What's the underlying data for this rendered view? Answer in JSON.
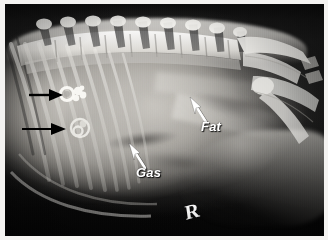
{
  "figure": {
    "modality": "radiograph",
    "view": "right lateral",
    "border_color": "#f4f3f1",
    "background_color": "#0b0b0b"
  },
  "annotations": {
    "labels": [
      {
        "id": "fat",
        "text": "Fat",
        "color": "#ffffff",
        "style": "bold-italic",
        "x": 196,
        "y": 115,
        "points_to": "retroperitoneal / falciform fat plane"
      },
      {
        "id": "gas",
        "text": "Gas",
        "color": "#ffffff",
        "style": "bold-italic",
        "x": 131,
        "y": 161,
        "points_to": "intraluminal bowel gas"
      }
    ],
    "arrows": [
      {
        "id": "arrow-fat",
        "color": "#ffffff",
        "direction": "up-left",
        "tail_x": 199,
        "tail_y": 117,
        "head_x": 186,
        "head_y": 95
      },
      {
        "id": "arrow-gas",
        "color": "#ffffff",
        "direction": "up-left",
        "tail_x": 139,
        "tail_y": 162,
        "head_x": 126,
        "head_y": 141
      },
      {
        "id": "arrow-black-upper",
        "color": "#000000",
        "direction": "right",
        "tail_x": 24,
        "tail_y": 90,
        "head_x": 52,
        "head_y": 90,
        "points_to": "mineral opacity, cranial"
      },
      {
        "id": "arrow-black-lower",
        "color": "#000000",
        "direction": "right",
        "tail_x": 17,
        "tail_y": 124,
        "head_x": 60,
        "head_y": 124,
        "points_to": "mineral opacity, caudal"
      }
    ],
    "markers": [
      {
        "id": "side-marker",
        "text": "R",
        "meaning": "right-side radiographic marker",
        "color": "#ffffff",
        "x": 180,
        "y": 196
      }
    ]
  },
  "anatomy": {
    "regions": [
      {
        "name": "lumbar-spine",
        "description": "vertebral bodies with dorsal spinous processes along the top"
      },
      {
        "name": "ribcage",
        "description": "caudal ribs over the left third of the image"
      },
      {
        "name": "pelvis",
        "description": "ilium, sacrum and femoral head at the right"
      },
      {
        "name": "abdomen",
        "description": "soft tissue viscera filling the central field"
      },
      {
        "name": "mineral-opacities",
        "description": "two bright ring-shaped mineral opacities indicated by black arrows"
      }
    ],
    "vertebra_count": 9,
    "rib_count": 9
  }
}
